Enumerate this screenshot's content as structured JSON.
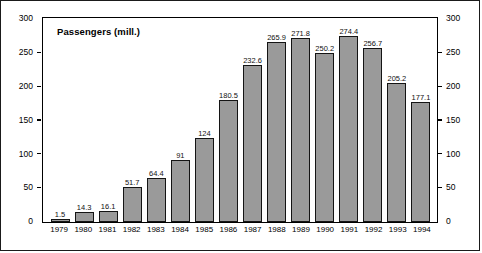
{
  "chart_data": {
    "type": "bar",
    "title": "Passengers (mill.)",
    "xlabel": "",
    "ylabel": "",
    "ylim": [
      0,
      300
    ],
    "yticks": [
      0,
      50,
      100,
      150,
      200,
      250,
      300
    ],
    "grid": false,
    "legend": null,
    "dual_y_axis": true,
    "categories": [
      "1979",
      "1980",
      "1981",
      "1982",
      "1983",
      "1984",
      "1985",
      "1986",
      "1987",
      "1988",
      "1989",
      "1990",
      "1991",
      "1992",
      "1993",
      "1994"
    ],
    "values": [
      1.5,
      14.3,
      16.1,
      51.7,
      64.4,
      91,
      124,
      180.5,
      232.6,
      265.9,
      271.8,
      250.2,
      274.4,
      256.7,
      205.2,
      177.1
    ],
    "value_labels": [
      "1.5",
      "14.3",
      "16.1",
      "51.7",
      "64.4",
      "91",
      "124",
      "180.5",
      "232.6",
      "265.9",
      "271.8",
      "250.2",
      "274.4",
      "256.7",
      "205.2",
      "177.1"
    ],
    "bar_fill_color": "#9a9a9a",
    "bar_border_color": "#141414",
    "axis_color": "#000000"
  },
  "axes": {
    "left_tick_labels": [
      "300",
      "250",
      "200",
      "150",
      "100",
      "50",
      "0"
    ],
    "right_tick_labels": [
      "300",
      "250",
      "200",
      "150",
      "100",
      "50",
      "0"
    ]
  }
}
